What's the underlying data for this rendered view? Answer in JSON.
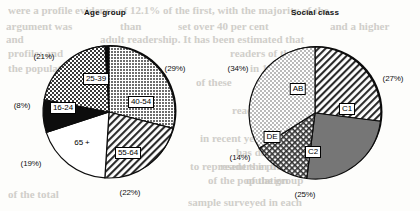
{
  "page": {
    "background_color": "#fdfdfb",
    "bleed_through_lines": [
      {
        "text": "were a profile evidence of 12.1% of the first, with the majority of the",
        "x": 8,
        "y": 4,
        "size": 11
      },
      {
        "text": "argument was",
        "x": 6,
        "y": 20,
        "size": 11
      },
      {
        "text": "than",
        "x": 120,
        "y": 20,
        "size": 11
      },
      {
        "text": "set over 40 per cent",
        "x": 178,
        "y": 20,
        "size": 11
      },
      {
        "text": "and a higher",
        "x": 330,
        "y": 20,
        "size": 11
      },
      {
        "text": "adult readership. It has been estimated that",
        "x": 100,
        "y": 33,
        "size": 11
      },
      {
        "text": "and",
        "x": 6,
        "y": 33,
        "size": 11
      },
      {
        "text": "profile: and",
        "x": 8,
        "y": 47,
        "size": 11
      },
      {
        "text": "readers of the popular",
        "x": 230,
        "y": 47,
        "size": 11
      },
      {
        "text": "the population",
        "x": 8,
        "y": 62,
        "size": 11
      },
      {
        "text": "in 1988 and",
        "x": 250,
        "y": 62,
        "size": 11
      },
      {
        "text": "of these",
        "x": 196,
        "y": 76,
        "size": 11
      },
      {
        "text": "the number",
        "x": 300,
        "y": 90,
        "size": 11
      },
      {
        "text": "readership",
        "x": 232,
        "y": 104,
        "size": 11
      },
      {
        "text": "the paper",
        "x": 252,
        "y": 118,
        "size": 11
      },
      {
        "text": "in recent years",
        "x": 200,
        "y": 132,
        "size": 11
      },
      {
        "text": "has declined",
        "x": 236,
        "y": 146,
        "size": 11
      },
      {
        "text": "readers in the",
        "x": 220,
        "y": 160,
        "size": 11
      },
      {
        "text": "of the group",
        "x": 246,
        "y": 174,
        "size": 11
      },
      {
        "text": "to represent the proportion",
        "x": 190,
        "y": 160,
        "size": 11
      },
      {
        "text": "of the population",
        "x": 208,
        "y": 174,
        "size": 11
      },
      {
        "text": "of the total",
        "x": 8,
        "y": 188,
        "size": 11
      },
      {
        "text": "sample surveyed in each",
        "x": 188,
        "y": 196,
        "size": 11
      }
    ]
  },
  "charts": [
    {
      "id": "age-group",
      "title": "Age group",
      "title_x": 107,
      "title_y": 14,
      "center": {
        "x": 109,
        "y": 112
      },
      "radius": 66,
      "chart_data": {
        "type": "pie",
        "title": "Age group",
        "categories": [
          "40-54",
          "55-64",
          "65 +",
          "16-24",
          "25-39"
        ],
        "values": [
          29,
          22,
          19,
          8,
          21
        ],
        "value_labels": [
          "(29%)",
          "(22%)",
          "(19%)",
          "(8%)",
          "(21%)"
        ],
        "units": "percent",
        "legend": "none",
        "start_angle_deg": 0,
        "direction": "clockwise"
      },
      "slices": [
        {
          "label": "40-54",
          "pct": 29,
          "pct_label": "(29%)",
          "fill": "dots-dark",
          "label_style": "boxed",
          "label_x": 141,
          "label_y": 102,
          "pct_x": 175,
          "pct_y": 68
        },
        {
          "label": "55-64",
          "pct": 22,
          "pct_label": "(22%)",
          "fill": "hatch-diag",
          "label_style": "boxed",
          "label_x": 128,
          "label_y": 153,
          "pct_x": 130,
          "pct_y": 192
        },
        {
          "label": "65 +",
          "pct": 19,
          "pct_label": "(19%)",
          "fill": "white",
          "label_style": "plain",
          "label_x": 82,
          "label_y": 142,
          "pct_x": 31,
          "pct_y": 163
        },
        {
          "label": "16-24",
          "pct": 8,
          "pct_label": "(8%)",
          "fill": "solid-black",
          "label_style": "boxed",
          "label_x": 63,
          "label_y": 108,
          "pct_x": 22,
          "pct_y": 105
        },
        {
          "label": "25-39",
          "pct": 21,
          "pct_label": "(21%)",
          "fill": "checker",
          "label_style": "boxed",
          "label_x": 96,
          "label_y": 79,
          "pct_x": 44,
          "pct_y": 56
        }
      ]
    },
    {
      "id": "social-class",
      "title": "Social class",
      "title_x": 105,
      "title_y": 14,
      "center": {
        "x": 105,
        "y": 113
      },
      "radius": 66,
      "chart_data": {
        "type": "pie",
        "title": "Social class",
        "categories": [
          "C1",
          "C2",
          "DE",
          "AB"
        ],
        "values": [
          27,
          25,
          14,
          34
        ],
        "value_labels": [
          "(27%)",
          "(25%)",
          "(14%)",
          "(34%)"
        ],
        "units": "percent",
        "legend": "none",
        "start_angle_deg": 0,
        "direction": "clockwise"
      },
      "slices": [
        {
          "label": "C1",
          "pct": 27,
          "pct_label": "(27%)",
          "fill": "hatch-diag",
          "label_style": "boxed",
          "label_x": 137,
          "label_y": 109,
          "pct_x": 183,
          "pct_y": 78
        },
        {
          "label": "C2",
          "pct": 25,
          "pct_label": "(25%)",
          "fill": "solid-gray",
          "label_style": "boxed",
          "label_x": 103,
          "label_y": 152,
          "pct_x": 95,
          "pct_y": 194
        },
        {
          "label": "DE",
          "pct": 14,
          "pct_label": "(14%)",
          "fill": "crosshatch",
          "label_style": "boxed",
          "label_x": 62,
          "label_y": 137,
          "pct_x": 30,
          "pct_y": 157
        },
        {
          "label": "AB",
          "pct": 34,
          "pct_label": "(34%)",
          "fill": "dots-light",
          "label_style": "boxed",
          "label_x": 88,
          "label_y": 89,
          "pct_x": 28,
          "pct_y": 68
        }
      ]
    }
  ]
}
